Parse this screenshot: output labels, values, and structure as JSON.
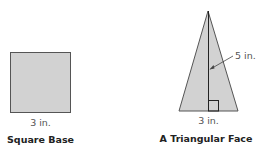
{
  "figures": [
    {
      "name": "square-base",
      "shape": "square",
      "side_label": "3 in.",
      "caption": "Square Base",
      "fill": "#d2d2d2",
      "stroke": "#555555"
    },
    {
      "name": "triangular-face",
      "shape": "isosceles-triangle",
      "base_label": "3 in.",
      "height_label": "5 in.",
      "caption": "A Triangular Face",
      "fill": "#d2d2d2",
      "stroke": "#555555",
      "right_angle_marker": true
    }
  ]
}
